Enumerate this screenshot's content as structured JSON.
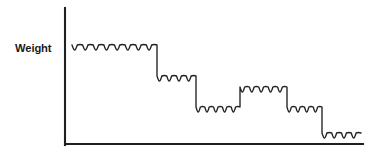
{
  "figure": {
    "title": "",
    "background_color": "#ffffff",
    "line_color": "#231f20",
    "axis_color": "#231f20"
  },
  "axes": {
    "y_label": "Weight",
    "x_label": "",
    "y_axis": {
      "x": 65,
      "y_top": 8,
      "y_bottom": 145
    },
    "x_axis": {
      "y": 144,
      "x_left": 65,
      "x_right": 363
    },
    "grid": false,
    "tick_labels_x": [],
    "tick_labels_y": []
  },
  "chart_data": {
    "type": "line",
    "title": "",
    "subtitle": "",
    "xlabel": "",
    "ylabel": "Weight",
    "grid": false,
    "legend": [],
    "annotations": [],
    "xlim": [
      0,
      100
    ],
    "ylim": [
      0,
      100
    ],
    "y_axis_direction": "weight decreasing downward",
    "plateaus": [
      {
        "index": 1,
        "name": "plateau-1",
        "x_start": 72,
        "x_end": 157,
        "y_level": 45,
        "bumps": 8,
        "weight_value": 95,
        "trend": "start"
      },
      {
        "index": 2,
        "name": "plateau-2",
        "x_start": 157,
        "x_end": 196,
        "y_level": 76,
        "bumps": 4,
        "weight_value": 73,
        "trend": "down"
      },
      {
        "index": 3,
        "name": "plateau-3",
        "x_start": 196,
        "x_end": 240,
        "y_level": 107,
        "bumps": 5,
        "weight_value": 50,
        "trend": "down"
      },
      {
        "index": 4,
        "name": "plateau-4",
        "x_start": 240,
        "x_end": 287,
        "y_level": 87,
        "bumps": 5,
        "weight_value": 65,
        "trend": "up"
      },
      {
        "index": 5,
        "name": "plateau-5",
        "x_start": 287,
        "x_end": 322,
        "y_level": 107,
        "bumps": 4,
        "weight_value": 50,
        "trend": "down"
      },
      {
        "index": 6,
        "name": "plateau-6",
        "x_start": 322,
        "x_end": 361,
        "y_level": 133,
        "bumps": 4,
        "weight_value": 31,
        "trend": "down"
      }
    ],
    "wave": {
      "amplitude": 3.4,
      "style": "sinusoidal-ripple"
    },
    "series": [
      {
        "name": "Weight over time",
        "x": [
          72,
          157,
          157,
          196,
          196,
          240,
          240,
          287,
          287,
          322,
          322,
          361
        ],
        "values": [
          95,
          95,
          73,
          73,
          50,
          50,
          65,
          65,
          50,
          50,
          31,
          31
        ]
      }
    ]
  }
}
